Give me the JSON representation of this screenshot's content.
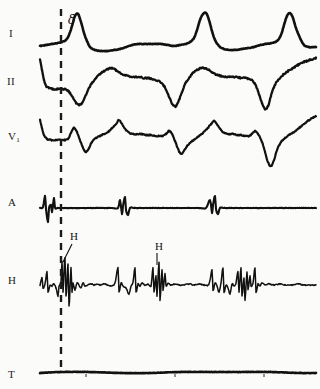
{
  "figure": {
    "kind": "electrophysiology-recording",
    "background_color": "#fbfbfa",
    "trace_color": "#111111",
    "width": 320,
    "height": 389
  },
  "channels": [
    {
      "id": "I",
      "label": "I",
      "label_sub": "",
      "label_x": 9,
      "label_y": 34,
      "baseline": 44,
      "row_top": 8,
      "row_height": 52
    },
    {
      "id": "II",
      "label": "II",
      "label_sub": "",
      "label_x": 7,
      "label_y": 82,
      "baseline": 88,
      "row_top": 60,
      "row_height": 50
    },
    {
      "id": "V1",
      "label": "V",
      "label_sub": "1",
      "label_x": 8,
      "label_y": 137,
      "baseline": 140,
      "row_top": 110,
      "row_height": 62
    },
    {
      "id": "A",
      "label": "A",
      "label_sub": "",
      "label_x": 8,
      "label_y": 203,
      "baseline": 208,
      "row_top": 178,
      "row_height": 48
    },
    {
      "id": "H",
      "label": "H",
      "label_sub": "",
      "label_x": 8,
      "label_y": 281,
      "baseline": 285,
      "row_top": 236,
      "row_height": 106
    },
    {
      "id": "T",
      "label": "T",
      "label_sub": "",
      "label_x": 8,
      "label_y": 375,
      "baseline": 372,
      "row_top": 356,
      "row_height": 28
    }
  ],
  "marker_line": {
    "name": "delta-onset-marker",
    "style": "dashed",
    "x": 61,
    "y_top": 9,
    "y_bottom": 371,
    "dash": "7 6",
    "width": 2.4,
    "color": "#1a1a1a"
  },
  "annotations": [
    {
      "id": "delta",
      "text": "δ",
      "x": 68,
      "y": 24,
      "leader": false
    },
    {
      "id": "his-1",
      "text": "H",
      "x": 70,
      "y": 239,
      "leader": true,
      "leader_path": "M 72 244 L 63 262"
    },
    {
      "id": "his-2",
      "text": "H",
      "x": 155,
      "y": 249,
      "leader": true,
      "leader_path": "M 157 253 L 157 265"
    }
  ],
  "chart_data": {
    "type": "line",
    "title": "",
    "xlabel": "",
    "ylabel": "",
    "grid": false,
    "legend": "none",
    "x_range": [
      40,
      316
    ],
    "series": [
      {
        "name": "I",
        "baseline_y": 44,
        "points": "40,46 46,45 52,44 58,43 62,42 66,40 69,35 72,26 75,16 78,14 81,22 84,33 87,41 90,47 95,50 101,51 108,51 114,50 120,49 126,47 132,45 138,44 144,44 150,44 156,44 162,44 168,45 174,46 180,45 186,44 190,42 194,38 197,30 200,20 203,14 206,13 209,20 212,31 215,40 219,46 224,49 230,50 236,50 242,49 248,48 254,47 260,45 266,44 272,43 277,41 281,35 284,25 287,16 290,13 293,18 296,28 300,38 304,45 309,47 314,47 316,47"
      },
      {
        "name": "II",
        "baseline_y": 88,
        "points": "40,60 42,70 44,80 46,86 49,88 53,89 58,89 63,89 67,90 70,93 73,98 76,103 79,105 82,103 85,97 88,90 92,83 96,78 100,74 104,71 108,69 112,68 116,70 120,73 124,75 128,76 132,77 136,77 140,77 144,78 148,78 152,79 156,80 160,82 164,86 167,92 170,99 173,105 176,106 179,100 182,92 185,84 189,78 193,73 197,70 201,68 205,68 209,70 213,73 217,75 221,76 225,77 229,77 233,77 237,77 241,78 245,78 249,79 253,81 256,86 259,94 262,103 265,109 268,106 271,96 274,87 278,80 283,75 288,71 293,68 298,65 304,62 310,60 316,58"
      },
      {
        "name": "V1",
        "baseline_y": 140,
        "points": "40,120 42,128 44,135 47,139 51,140 56,140 61,140 65,140 68,139 71,133 74,128 77,132 80,140 83,148 86,152 89,148 92,142 96,138 100,136 104,134 108,132 112,128 116,124 119,120 122,124 126,130 130,133 134,134 138,134 142,134 146,135 150,135 154,136 158,136 162,136 166,134 169,131 172,134 175,141 178,149 181,154 184,151 187,146 191,142 195,139 199,136 203,133 207,129 211,124 214,121 217,124 221,130 225,133 229,134 233,134 237,135 241,135 245,136 249,136 252,134 255,131 258,134 262,142 265,152 268,162 271,166 274,160 277,150 281,142 285,138 289,135 294,132 299,128 304,124 309,120 314,117 316,116"
      },
      {
        "name": "A",
        "baseline_y": 208,
        "spike_times": [
          46,
          50,
          54,
          122,
          126,
          214,
          218
        ],
        "points": "40,208 43,207 45,196 46,209 48,222 49,208 51,205 52,212 54,198 55,208 58,208 64,208 70,208 76,208 82,208 88,208 94,208 100,208 106,208 112,208 118,208 120,200 122,214 123,206 125,197 126,210 128,215 130,208 134,208 140,208 146,208 152,208 158,208 164,208 170,208 176,208 182,208 188,208 194,208 200,208 206,208 210,200 212,213 213,205 215,196 216,209 218,214 220,208 224,208 230,208 236,208 242,208 248,208 254,208 260,208 266,208 272,208 278,208 284,208 290,208 296,208 302,208 308,208 314,208 316,208"
      },
      {
        "name": "H",
        "baseline_y": 285,
        "points": "40,285 42,278 43,288 45,284 47,272 48,292 50,285 52,286 54,284 56,288 58,296 59,286 61,282 62,262 63,292 64,272 65,258 66,296 67,282 68,264 69,306 70,288 71,268 72,292 73,283 75,290 77,283 79,285 81,288 83,283 85,286 88,285 91,284 94,285 97,284 100,285 104,284 108,285 112,286 115,283 118,268 119,292 121,283 123,286 126,288 129,294 131,286 133,282 135,268 136,292 138,284 140,286 142,283 145,285 148,284 151,286 153,268 154,292 156,276 157,296 159,262 160,300 162,270 163,290 165,274 166,286 168,283 171,285 175,284 179,285 184,285 189,284 194,285 199,284 204,285 209,284 212,270 213,290 215,283 217,286 219,292 221,283 223,268 224,292 226,285 228,288 230,294 232,284 234,286 236,283 238,272 239,292 241,268 242,296 244,278 245,300 247,272 248,290 250,276 251,286 253,283 255,268 256,292 258,284 260,286 262,283 265,285 269,284 274,285 280,284 286,285 292,285 298,284 304,285 310,285 316,285"
      },
      {
        "name": "T",
        "baseline_y": 372,
        "points": "40,373 60,372 90,372 120,373 150,373 180,372 210,372 240,372 270,372 300,373 316,373",
        "tick_marks": [
          86,
          175,
          264
        ]
      }
    ]
  }
}
